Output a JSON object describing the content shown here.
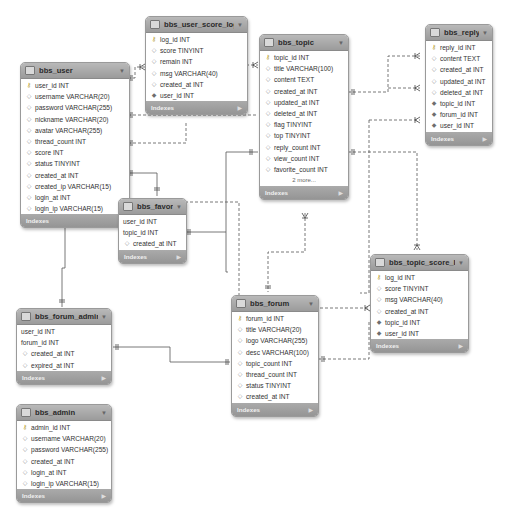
{
  "diagram": {
    "type": "er-diagram",
    "colors": {
      "header": "#a9a9a9",
      "footer": "#9e9e9e",
      "line": "#555555",
      "background": "#ffffff"
    },
    "tables": {
      "bbs_user": {
        "name": "bbs_user",
        "indexes_label": "Indexes",
        "columns": [
          {
            "text": "user_id INT",
            "kind": "pk"
          },
          {
            "text": "username VARCHAR(20)",
            "kind": "col"
          },
          {
            "text": "password VARCHAR(255)",
            "kind": "col"
          },
          {
            "text": "nickname VARCHAR(20)",
            "kind": "col"
          },
          {
            "text": "avatar VARCHAR(255)",
            "kind": "col"
          },
          {
            "text": "thread_count INT",
            "kind": "col"
          },
          {
            "text": "score INT",
            "kind": "col"
          },
          {
            "text": "status TINYINT",
            "kind": "col"
          },
          {
            "text": "created_at INT",
            "kind": "col"
          },
          {
            "text": "created_ip VARCHAR(15)",
            "kind": "col"
          },
          {
            "text": "login_at INT",
            "kind": "col"
          },
          {
            "text": "login_ip VARCHAR(15)",
            "kind": "col"
          }
        ]
      },
      "bbs_user_score_log": {
        "name": "bbs_user_score_log",
        "indexes_label": "Indexes",
        "columns": [
          {
            "text": "log_id INT",
            "kind": "pk"
          },
          {
            "text": "score TINYINT",
            "kind": "col"
          },
          {
            "text": "remain INT",
            "kind": "col"
          },
          {
            "text": "msg VARCHAR(40)",
            "kind": "col"
          },
          {
            "text": "created_at INT",
            "kind": "col"
          },
          {
            "text": "user_id INT",
            "kind": "fk"
          }
        ]
      },
      "bbs_topic": {
        "name": "bbs_topic",
        "indexes_label": "Indexes",
        "more_label": "2 more...",
        "columns": [
          {
            "text": "topic_id INT",
            "kind": "pk"
          },
          {
            "text": "title VARCHAR(100)",
            "kind": "col"
          },
          {
            "text": "content TEXT",
            "kind": "col"
          },
          {
            "text": "created_at INT",
            "kind": "col"
          },
          {
            "text": "updated_at INT",
            "kind": "col"
          },
          {
            "text": "deleted_at INT",
            "kind": "col"
          },
          {
            "text": "flag TINYINT",
            "kind": "col"
          },
          {
            "text": "top TINYINT",
            "kind": "col"
          },
          {
            "text": "reply_count INT",
            "kind": "col"
          },
          {
            "text": "view_count INT",
            "kind": "col"
          },
          {
            "text": "favorite_count INT",
            "kind": "col"
          }
        ]
      },
      "bbs_reply": {
        "name": "bbs_reply",
        "indexes_label": "Indexes",
        "columns": [
          {
            "text": "reply_id INT",
            "kind": "pk"
          },
          {
            "text": "content TEXT",
            "kind": "col"
          },
          {
            "text": "created_at INT",
            "kind": "col"
          },
          {
            "text": "updated_at INT",
            "kind": "col"
          },
          {
            "text": "deleted_at INT",
            "kind": "col"
          },
          {
            "text": "topic_id INT",
            "kind": "fk"
          },
          {
            "text": "forum_id INT",
            "kind": "fk"
          },
          {
            "text": "user_id INT",
            "kind": "fk"
          }
        ]
      },
      "bbs_favorite": {
        "name": "bbs_favorite",
        "indexes_label": "Indexes",
        "columns": [
          {
            "text": "user_id INT",
            "kind": "none"
          },
          {
            "text": "topic_id INT",
            "kind": "none"
          },
          {
            "text": "created_at INT",
            "kind": "col"
          }
        ]
      },
      "bbs_topic_score_log": {
        "name": "bbs_topic_score_log",
        "indexes_label": "Indexes",
        "columns": [
          {
            "text": "log_id INT",
            "kind": "pk"
          },
          {
            "text": "score TINYINT",
            "kind": "col"
          },
          {
            "text": "msg VARCHAR(40)",
            "kind": "col"
          },
          {
            "text": "created_at INT",
            "kind": "col"
          },
          {
            "text": "topic_id INT",
            "kind": "fk"
          },
          {
            "text": "user_id INT",
            "kind": "fk"
          }
        ]
      },
      "bbs_forum": {
        "name": "bbs_forum",
        "indexes_label": "Indexes",
        "columns": [
          {
            "text": "forum_id INT",
            "kind": "pk"
          },
          {
            "text": "title VARCHAR(20)",
            "kind": "col"
          },
          {
            "text": "logo VARCHAR(255)",
            "kind": "col"
          },
          {
            "text": "desc VARCHAR(100)",
            "kind": "col"
          },
          {
            "text": "topic_count INT",
            "kind": "col"
          },
          {
            "text": "thread_count INT",
            "kind": "col"
          },
          {
            "text": "status TINYINT",
            "kind": "col"
          },
          {
            "text": "created_at INT",
            "kind": "col"
          }
        ]
      },
      "bbs_forum_admin": {
        "name": "bbs_forum_admin",
        "indexes_label": "Indexes",
        "columns": [
          {
            "text": "user_id INT",
            "kind": "none"
          },
          {
            "text": "forum_id INT",
            "kind": "none"
          },
          {
            "text": "created_at INT",
            "kind": "col"
          },
          {
            "text": "expired_at INT",
            "kind": "col"
          }
        ]
      },
      "bbs_admin": {
        "name": "bbs_admin",
        "indexes_label": "Indexes",
        "columns": [
          {
            "text": "admin_id INT",
            "kind": "pk"
          },
          {
            "text": "username VARCHAR(20)",
            "kind": "col"
          },
          {
            "text": "password VARCHAR(255)",
            "kind": "col"
          },
          {
            "text": "created_at INT",
            "kind": "col"
          },
          {
            "text": "login_at INT",
            "kind": "col"
          },
          {
            "text": "login_ip VARCHAR(15)",
            "kind": "col"
          }
        ]
      }
    },
    "relationships": [
      {
        "from": "bbs_user",
        "to": "bbs_user_score_log",
        "style": "dashed"
      },
      {
        "from": "bbs_user",
        "to": "bbs_topic",
        "style": "dashed"
      },
      {
        "from": "bbs_user",
        "to": "bbs_reply",
        "style": "dashed"
      },
      {
        "from": "bbs_user",
        "to": "bbs_favorite",
        "style": "solid"
      },
      {
        "from": "bbs_user",
        "to": "bbs_forum_admin",
        "style": "solid"
      },
      {
        "from": "bbs_topic",
        "to": "bbs_reply",
        "style": "dashed"
      },
      {
        "from": "bbs_topic",
        "to": "bbs_favorite",
        "style": "solid"
      },
      {
        "from": "bbs_topic",
        "to": "bbs_topic_score_log",
        "style": "dashed"
      },
      {
        "from": "bbs_forum",
        "to": "bbs_topic",
        "style": "dashed"
      },
      {
        "from": "bbs_forum",
        "to": "bbs_reply",
        "style": "dashed"
      },
      {
        "from": "bbs_forum",
        "to": "bbs_forum_admin",
        "style": "solid"
      },
      {
        "from": "bbs_forum",
        "to": "bbs_topic_score_log",
        "style": "dashed"
      },
      {
        "from": "bbs_user",
        "to": "bbs_topic_score_log",
        "style": "dashed"
      }
    ]
  }
}
